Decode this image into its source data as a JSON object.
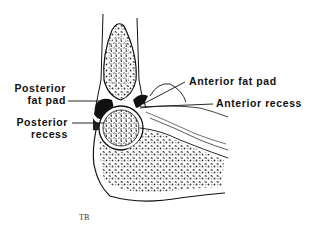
{
  "diagram": {
    "labels": {
      "posterior_fat_pad": [
        "Posterior",
        "fat pad"
      ],
      "posterior_recess": [
        "Posterior",
        "recess"
      ],
      "anterior_fat_pad": "Anterior fat pad",
      "anterior_recess": "Anterior recess"
    },
    "signature": "TB",
    "colors": {
      "ink": "#111111",
      "background": "#ffffff"
    }
  }
}
